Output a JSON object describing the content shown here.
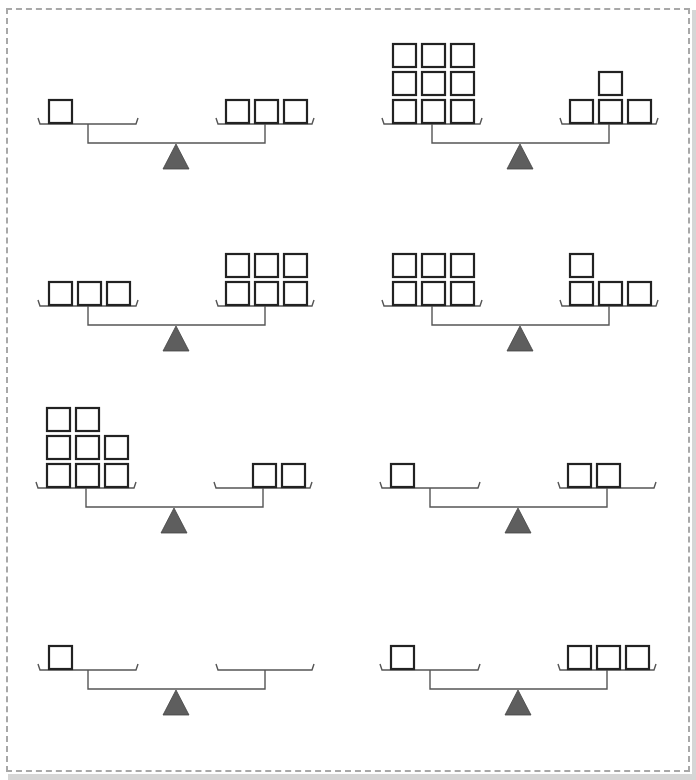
{
  "worksheet": {
    "frame_style": "dashed",
    "colors": {
      "border": "#a8a8a8",
      "box_stroke": "#222222",
      "fulcrum": "#5e5e5e",
      "beam": "#555555"
    },
    "scales": [
      {
        "id": 1,
        "origin": [
          0,
          0
        ],
        "left": {
          "count": 1,
          "rows": [
            [
              1
            ]
          ],
          "align": "left"
        },
        "right": {
          "count": 3,
          "rows": [
            [
              1,
              1,
              1
            ]
          ],
          "align": "left"
        }
      },
      {
        "id": 2,
        "origin": [
          344,
          0
        ],
        "left": {
          "count": 9,
          "rows": [
            [
              1,
              1,
              1
            ],
            [
              1,
              1,
              1
            ],
            [
              1,
              1,
              1
            ]
          ],
          "align": "left"
        },
        "right": {
          "count": 4,
          "rows": [
            [
              1,
              1,
              1
            ],
            [
              0,
              1,
              0
            ]
          ],
          "align": "left"
        }
      },
      {
        "id": 3,
        "origin": [
          0,
          182
        ],
        "left": {
          "count": 3,
          "rows": [
            [
              1,
              1,
              1
            ]
          ],
          "align": "left"
        },
        "right": {
          "count": 6,
          "rows": [
            [
              1,
              1,
              1
            ],
            [
              1,
              1,
              1
            ]
          ],
          "align": "left"
        }
      },
      {
        "id": 4,
        "origin": [
          344,
          182
        ],
        "left": {
          "count": 6,
          "rows": [
            [
              1,
              1,
              1
            ],
            [
              1,
              1,
              1
            ]
          ],
          "align": "left"
        },
        "right": {
          "count": 4,
          "rows": [
            [
              1,
              1,
              1
            ],
            [
              1,
              0,
              0
            ]
          ],
          "align": "left"
        }
      },
      {
        "id": 5,
        "origin": [
          -2,
          364
        ],
        "left": {
          "count": 8,
          "rows": [
            [
              1,
              1,
              1
            ],
            [
              1,
              1,
              1
            ],
            [
              1,
              1,
              0
            ]
          ],
          "align": "left"
        },
        "right": {
          "count": 2,
          "rows": [
            [
              0,
              1,
              1
            ]
          ],
          "align": "left"
        }
      },
      {
        "id": 6,
        "origin": [
          342,
          364
        ],
        "left": {
          "count": 1,
          "rows": [
            [
              1
            ]
          ],
          "align": "left"
        },
        "right": {
          "count": 2,
          "rows": [
            [
              1,
              1
            ]
          ],
          "align": "left"
        }
      },
      {
        "id": 7,
        "origin": [
          0,
          546
        ],
        "left": {
          "count": 1,
          "rows": [
            [
              1
            ]
          ],
          "align": "left"
        },
        "right": {
          "count": 0,
          "rows": [],
          "align": "left"
        }
      },
      {
        "id": 8,
        "origin": [
          342,
          546
        ],
        "left": {
          "count": 1,
          "rows": [
            [
              1
            ]
          ],
          "align": "left"
        },
        "right": {
          "count": 3,
          "rows": [
            [
              1,
              1,
              1
            ]
          ],
          "align": "left"
        }
      }
    ]
  }
}
